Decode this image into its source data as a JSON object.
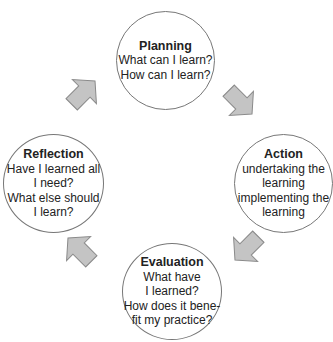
{
  "diagram": {
    "type": "cycle",
    "nodes": [
      {
        "id": "planning",
        "title": "Planning",
        "lines": [
          "What can I learn?",
          "How can I learn?"
        ]
      },
      {
        "id": "action",
        "title": "Action",
        "lines": [
          "undertaking the",
          "learning",
          "implementing the",
          "learning"
        ]
      },
      {
        "id": "evaluation",
        "title": "Evaluation",
        "lines": [
          "What have",
          "I learned?",
          "How does it bene-",
          "fit my practice?"
        ]
      },
      {
        "id": "reflection",
        "title": "Reflection",
        "lines": [
          "Have I learned all",
          "I need?",
          "What else should",
          "I learn?"
        ]
      }
    ],
    "edges": [
      {
        "from": "planning",
        "to": "action"
      },
      {
        "from": "action",
        "to": "evaluation"
      },
      {
        "from": "evaluation",
        "to": "reflection"
      },
      {
        "from": "reflection",
        "to": "planning"
      }
    ],
    "colors": {
      "arrow_fill": "#c4c4c4",
      "arrow_stroke": "#8a8a8a",
      "circle_stroke": "#777777"
    }
  }
}
